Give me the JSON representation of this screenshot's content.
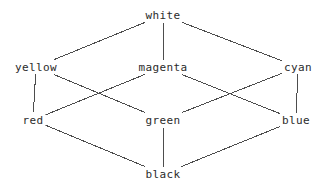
{
  "diagram": {
    "type": "hasse-lattice",
    "width": 329,
    "height": 189,
    "background_color": "#ffffff",
    "text_color": "#2b2b2b",
    "edge_color": "#4d4d4d",
    "edge_width": 1,
    "nodes": [
      {
        "id": "white",
        "label": "white",
        "x": 163,
        "y": 15,
        "rank": 0
      },
      {
        "id": "yellow",
        "label": "yellow",
        "x": 36,
        "y": 67,
        "rank": 1
      },
      {
        "id": "magenta",
        "label": "magenta",
        "x": 163,
        "y": 67,
        "rank": 1
      },
      {
        "id": "cyan",
        "label": "cyan",
        "x": 298,
        "y": 67,
        "rank": 1
      },
      {
        "id": "red",
        "label": "red",
        "x": 33,
        "y": 120,
        "rank": 2
      },
      {
        "id": "green",
        "label": "green",
        "x": 163,
        "y": 120,
        "rank": 2
      },
      {
        "id": "blue",
        "label": "blue",
        "x": 296,
        "y": 120,
        "rank": 2
      },
      {
        "id": "black",
        "label": "black",
        "x": 163,
        "y": 174,
        "rank": 3
      }
    ],
    "edges": [
      {
        "from": "white",
        "to": "yellow"
      },
      {
        "from": "white",
        "to": "magenta"
      },
      {
        "from": "white",
        "to": "cyan"
      },
      {
        "from": "yellow",
        "to": "red"
      },
      {
        "from": "yellow",
        "to": "green"
      },
      {
        "from": "magenta",
        "to": "red"
      },
      {
        "from": "magenta",
        "to": "blue"
      },
      {
        "from": "cyan",
        "to": "green"
      },
      {
        "from": "cyan",
        "to": "blue"
      },
      {
        "from": "red",
        "to": "black"
      },
      {
        "from": "green",
        "to": "black"
      },
      {
        "from": "blue",
        "to": "black"
      }
    ]
  }
}
